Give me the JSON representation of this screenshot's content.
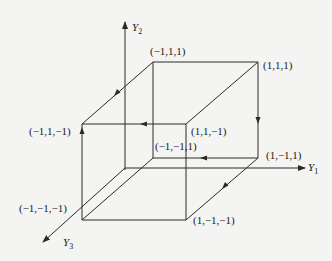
{
  "diagram": {
    "type": "3d-cube-state-diagram",
    "axes": [
      {
        "id": "y1",
        "label": "Y",
        "subscript": "1"
      },
      {
        "id": "y2",
        "label": "Y",
        "subscript": "2"
      },
      {
        "id": "y3",
        "label": "Y",
        "subscript": "3"
      }
    ],
    "vertices": [
      {
        "id": "v_m1_1_1",
        "label": "(−1,1,1)"
      },
      {
        "id": "v_1_1_1",
        "label": "(1,1,1)"
      },
      {
        "id": "v_m1_1_m1",
        "label": "(−1,1,−1)"
      },
      {
        "id": "v_1_1_m1",
        "label": "(1,1,−1)"
      },
      {
        "id": "v_m1_m1_1",
        "label": "(−1,−1,1)"
      },
      {
        "id": "v_1_m1_1",
        "label": "(1,−1,1)"
      },
      {
        "id": "v_m1_m1_m1",
        "label": "(−1,−1,−1)"
      },
      {
        "id": "v_1_m1_m1",
        "label": "(1,−1,−1)"
      }
    ],
    "directed_edges": [
      {
        "from": "(1,1,1)",
        "to": "(1,−1,1)"
      },
      {
        "from": "(1,−1,1)",
        "to": "(−1,−1,1)"
      },
      {
        "from": "(1,−1,1)",
        "to": "(1,−1,−1)"
      },
      {
        "from": "(−1,1,1)",
        "to": "(−1,1,−1)"
      },
      {
        "from": "(1,1,−1)",
        "to": "(−1,1,−1)"
      },
      {
        "from": "(−1,−1,−1)",
        "to": "(−1,1,−1)"
      }
    ],
    "colors": {
      "line": "#2a2a2a",
      "background": "#f4f4f2"
    }
  }
}
